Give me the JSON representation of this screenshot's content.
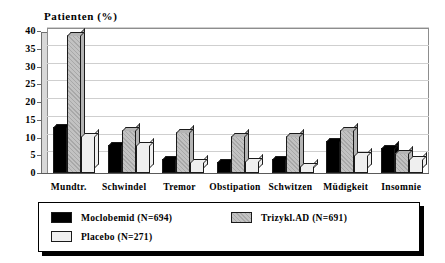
{
  "chart_data": {
    "type": "bar",
    "title": "Patienten (%)",
    "xlabel": "",
    "ylabel": "",
    "ylim": [
      0,
      40
    ],
    "yticks": [
      0,
      5,
      10,
      15,
      20,
      25,
      30,
      35,
      40
    ],
    "grid": true,
    "legend_position": "bottom",
    "categories": [
      "Mundtr.",
      "Schwindel",
      "Tremor",
      "Obstipation",
      "Schwitzen",
      "Müdigkeit",
      "Insomnie"
    ],
    "series": [
      {
        "name": "Moclobemid (N=694)",
        "color": "#000000",
        "values": [
          13,
          8,
          4,
          3,
          4,
          9,
          7
        ]
      },
      {
        "name": "Trizykl.AD (N=691)",
        "color": "#b4b4b4",
        "values": [
          39,
          12,
          11.5,
          10.5,
          10.5,
          12,
          5.5
        ]
      },
      {
        "name": "Placebo (N=271)",
        "color": "#efefef",
        "values": [
          10.5,
          8,
          3,
          3.5,
          2,
          5,
          4
        ]
      }
    ]
  },
  "legend": {
    "entries": [
      {
        "label": "Moclobemid (N=694)",
        "swatch": "swatch-black"
      },
      {
        "label": "Trizykl.AD (N=691)",
        "swatch": "swatch-gray"
      },
      {
        "label": "Placebo (N=271)",
        "swatch": "swatch-light"
      }
    ]
  }
}
